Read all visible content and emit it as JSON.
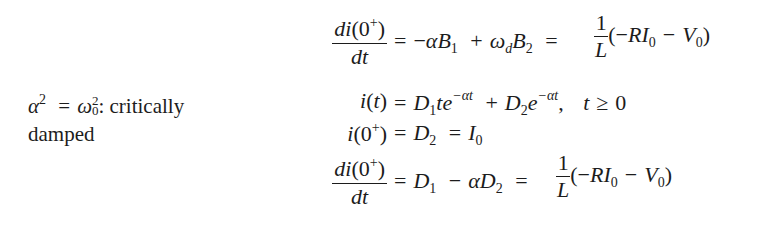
{
  "label": {
    "condition_alpha": "α",
    "condition_exp": "2",
    "condition_eq": "=",
    "condition_omega": "ω",
    "condition_omega_sub": "0",
    "condition_omega_sup": "2",
    "condition_text": ": critically",
    "condition_text2": "damped"
  },
  "equations": [
    {
      "id": "eq1",
      "lhs_num": "di(0⁺)",
      "lhs_den": "dt",
      "rhs": "= −αB₁ + ω_d B₂ = (1/L)(−RI₀ − V₀)"
    },
    {
      "id": "eq2",
      "lhs": "i(t)",
      "rhs": "= D₁te^(−αt) + D₂e^(−αt),  t ≥ 0"
    },
    {
      "id": "eq3",
      "lhs": "i(0⁺)",
      "rhs": "= D₂ = I₀"
    },
    {
      "id": "eq4",
      "lhs_num": "di(0⁺)",
      "lhs_den": "dt",
      "rhs": "= D₁ − αD₂ = (1/L)(−RI₀ − V₀)"
    }
  ],
  "symbols": {
    "d": "d",
    "i": "i",
    "t": "t",
    "zero": "0",
    "plus": "+",
    "minus": "−",
    "eq": "=",
    "alpha": "α",
    "omega": "ω",
    "B": "B",
    "D": "D",
    "R": "R",
    "I": "I",
    "V": "V",
    "L": "L",
    "one": "1",
    "two": "2",
    "e": "e",
    "geq": "≥",
    "comma": ",",
    "lparen": "(",
    "rparen": ")",
    "sub_d": "d",
    "exp_neg_alpha_t": "−αt"
  }
}
